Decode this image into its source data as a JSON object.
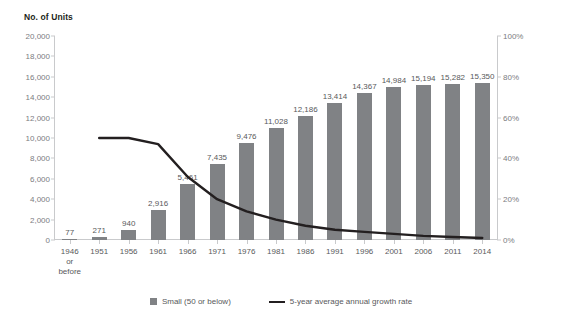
{
  "chart_data": {
    "type": "bar",
    "title": "",
    "ylabel": "No. of Units",
    "y2label": "",
    "xlabel": "",
    "grid": false,
    "legend_position": "bottom",
    "categories": [
      "1946 or before",
      "1951",
      "1956",
      "1961",
      "1966",
      "1971",
      "1976",
      "1981",
      "1986",
      "1991",
      "1996",
      "2001",
      "2006",
      "2011",
      "2014"
    ],
    "category_lines": [
      [
        "1946",
        "or",
        "before"
      ],
      [
        "1951"
      ],
      [
        "1956"
      ],
      [
        "1961"
      ],
      [
        "1966"
      ],
      [
        "1971"
      ],
      [
        "1976"
      ],
      [
        "1981"
      ],
      [
        "1986"
      ],
      [
        "1991"
      ],
      [
        "1996"
      ],
      [
        "2001"
      ],
      [
        "2006"
      ],
      [
        "2011"
      ],
      [
        "2014"
      ]
    ],
    "ylim": [
      0,
      20000
    ],
    "yticks": [
      0,
      2000,
      4000,
      6000,
      8000,
      10000,
      12000,
      14000,
      16000,
      18000,
      20000
    ],
    "ytick_labels": [
      "0",
      "2,000",
      "4,000",
      "6,000",
      "8,000",
      "10,000",
      "12,000",
      "14,000",
      "16,000",
      "18,000",
      "20,000"
    ],
    "y2lim": [
      0,
      100
    ],
    "y2ticks": [
      0,
      20,
      40,
      60,
      80,
      100
    ],
    "y2tick_labels": [
      "0%",
      "20%",
      "40%",
      "60%",
      "80%",
      "100%"
    ],
    "series": [
      {
        "name": "Small (50 or below)",
        "type": "bar",
        "color": "#808285",
        "axis": "left",
        "values": [
          77,
          271,
          940,
          2916,
          5461,
          7435,
          9476,
          11028,
          12186,
          13414,
          14367,
          14984,
          15194,
          15282,
          15350
        ],
        "labels": [
          "77",
          "271",
          "940",
          "2,916",
          "5,461",
          "7,435",
          "9,476",
          "11,028",
          "12,186",
          "13,414",
          "14,367",
          "14,984",
          "15,194",
          "15,282",
          "15,350"
        ]
      },
      {
        "name": "5-year average annual growth rate",
        "type": "line",
        "color": "#231f20",
        "axis": "right",
        "values": [
          null,
          50,
          50,
          47,
          31,
          20,
          14,
          10,
          7,
          5,
          4,
          3,
          2,
          1.5,
          1
        ]
      }
    ],
    "legend": [
      {
        "label": "Small (50 or below)",
        "marker": "square",
        "color": "#808285"
      },
      {
        "label": "5-year average annual growth rate",
        "marker": "line",
        "color": "#231f20"
      }
    ]
  }
}
